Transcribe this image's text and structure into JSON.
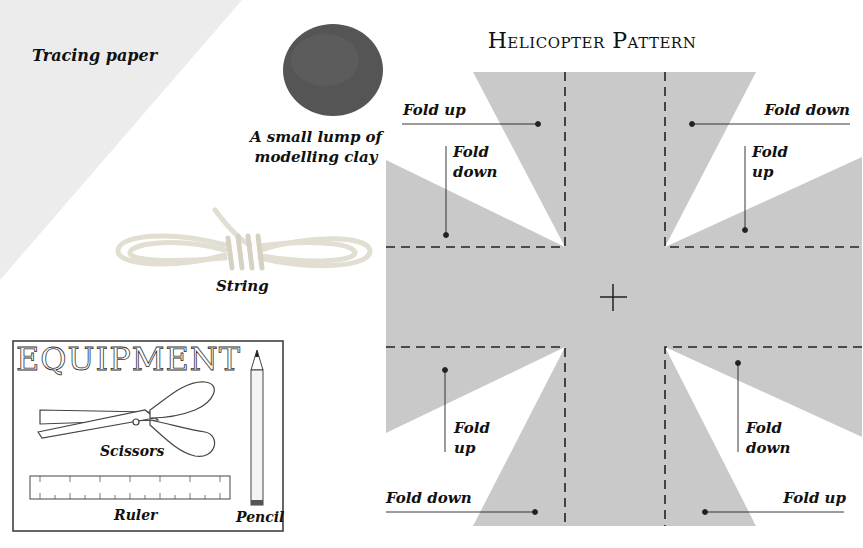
{
  "materials": {
    "tracing_paper": "Tracing paper",
    "clay_line1": "A small lump of",
    "clay_line2": "modelling clay",
    "string": "String"
  },
  "equipment": {
    "title": "EQUIPMENT",
    "scissors": "Scissors",
    "ruler": "Ruler",
    "pencil": "Pencil"
  },
  "pattern": {
    "title": "Helicopter Pattern",
    "labels": {
      "top_left": "Fold up",
      "top_right": "Fold down",
      "upper_left_a": "Fold",
      "upper_left_b": "down",
      "upper_right_a": "Fold",
      "upper_right_b": "up",
      "lower_left_a": "Fold",
      "lower_left_b": "up",
      "lower_right_a": "Fold",
      "lower_right_b": "down",
      "bottom_left": "Fold down",
      "bottom_right": "Fold up"
    },
    "colors": {
      "paper": "#c9c9c9",
      "tracing": "#ececec",
      "clay": "#5a5a5a",
      "line": "#222222"
    }
  }
}
